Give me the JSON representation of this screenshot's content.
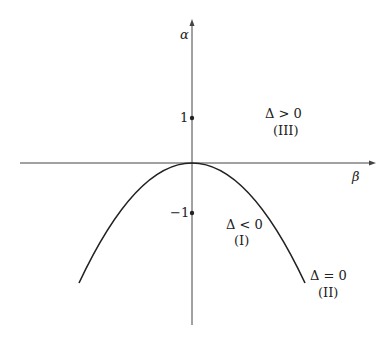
{
  "axes": {
    "x_label": "β",
    "y_label": "α",
    "ticks": [
      {
        "value": 1,
        "label": "1"
      },
      {
        "value": -1,
        "label": "−1"
      }
    ]
  },
  "curve": {
    "type": "parabola",
    "equation_hint": "downward parabola with vertex at origin"
  },
  "regions": [
    {
      "id": "III",
      "condition": "Δ > 0",
      "tag": "(III)"
    },
    {
      "id": "I",
      "condition": "Δ < 0",
      "tag": "(I)"
    },
    {
      "id": "II",
      "condition": "Δ = 0",
      "tag": "(II)"
    }
  ],
  "colors": {
    "axis": "#444444",
    "curve": "#222222",
    "background": "#ffffff"
  }
}
